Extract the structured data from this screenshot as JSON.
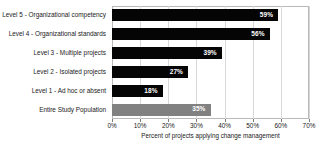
{
  "chart_data": {
    "type": "bar",
    "orientation": "horizontal",
    "title": "",
    "xlabel": "Percent of projects applying change management",
    "ylabel": "",
    "xlim": [
      0,
      70
    ],
    "xtick_labels": [
      "0%",
      "10%",
      "20%",
      "30%",
      "40%",
      "50%",
      "60%",
      "70%"
    ],
    "xtick_values": [
      0,
      10,
      20,
      30,
      40,
      50,
      60,
      70
    ],
    "grid": "vertical",
    "legend": "none",
    "value_label_suffix": "%",
    "categories": [
      "Level 5 - Organizational competency",
      "Level 4 - Organizational standards",
      "Level 3 - Multiple projects",
      "Level 2 - Isolated projects",
      "Level 1 - Ad hoc or absent",
      "Entire Study Population"
    ],
    "values": [
      59,
      56,
      39,
      27,
      18,
      35
    ],
    "value_labels": [
      "59%",
      "56%",
      "39%",
      "27%",
      "18%",
      "35%"
    ],
    "bar_colors": [
      "#050505",
      "#050505",
      "#050505",
      "#050505",
      "#050505",
      "#818181"
    ],
    "value_label_color": "#ffffff",
    "bars": [
      {
        "category": "Level 5 - Organizational competency",
        "value": 59,
        "label": "59%",
        "color": "#050505"
      },
      {
        "category": "Level 4 - Organizational standards",
        "value": 56,
        "label": "56%",
        "color": "#050505"
      },
      {
        "category": "Level 3 - Multiple projects",
        "value": 39,
        "label": "39%",
        "color": "#050505"
      },
      {
        "category": "Level 2 - Isolated projects",
        "value": 27,
        "label": "27%",
        "color": "#050505"
      },
      {
        "category": "Level 1 - Ad hoc or absent",
        "value": 18,
        "label": "18%",
        "color": "#050505"
      },
      {
        "category": "Entire Study Population",
        "value": 35,
        "label": "35%",
        "color": "#818181"
      }
    ]
  },
  "colors": {
    "background": "#ffffff",
    "bar_primary": "#050505",
    "bar_secondary": "#818181",
    "gridline": "#d8d8d8",
    "axis_border": "#b9b9b9",
    "text": "#1a1a1a"
  }
}
